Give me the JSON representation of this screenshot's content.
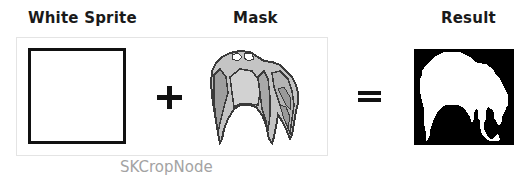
{
  "diagram": {
    "titles": {
      "white_sprite": "White Sprite",
      "mask": "Mask",
      "result": "Result"
    },
    "operators": {
      "plus": "+",
      "equals": "="
    },
    "caption": "SKCropNode",
    "colors": {
      "title_text": "#1a1a1a",
      "caption_text": "#a3a3a3",
      "frame_border": "#e4e4e4",
      "sprite_outline": "#111111",
      "mask_fill_light": "#c8c8c8",
      "mask_fill_mid": "#a8a8a8",
      "mask_outline": "#3a3a3a",
      "result_background": "#000000",
      "result_silhouette": "#ffffff"
    },
    "elements": [
      {
        "id": "white-sprite",
        "label": "White Sprite",
        "shape": "square",
        "fill": "#ffffff",
        "border": "#111111"
      },
      {
        "id": "mask",
        "label": "Mask",
        "shape": "pixel-art creature sprite",
        "fill": "gray"
      },
      {
        "id": "result",
        "label": "Result",
        "shape": "white creature silhouette on black square"
      }
    ]
  }
}
